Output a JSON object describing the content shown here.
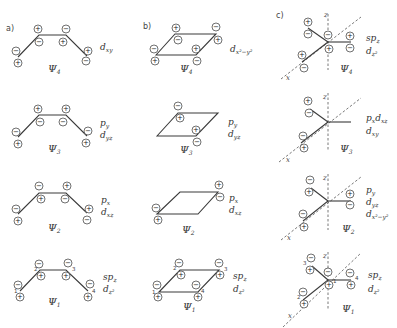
{
  "panels": [
    {
      "id": "a",
      "label": "a)",
      "type": "butadiene-chain"
    },
    {
      "id": "b",
      "label": "b)",
      "type": "cyclobutadiene-rhombus"
    },
    {
      "id": "c",
      "label": "c)",
      "type": "trimethylenemethane-star"
    }
  ],
  "orbitals": {
    "a": [
      {
        "name": "Ψ4",
        "psi": "Ψ",
        "sub": "4",
        "labels": [
          {
            "main": "d",
            "sub": "xy"
          }
        ],
        "atom_signs": [
          [
            "−",
            "+"
          ],
          [
            "+",
            "−"
          ],
          [
            "−",
            "+"
          ],
          [
            "+",
            "−"
          ]
        ]
      },
      {
        "name": "Ψ3",
        "psi": "Ψ",
        "sub": "3",
        "labels": [
          {
            "main": "p",
            "sub": "y"
          },
          {
            "main": "d",
            "sub": "yz"
          }
        ],
        "atom_signs": [
          [
            "−",
            "+"
          ],
          [
            "+",
            "−"
          ],
          [
            "+",
            "−"
          ],
          [
            "−",
            "+"
          ]
        ]
      },
      {
        "name": "Ψ2",
        "psi": "Ψ",
        "sub": "2",
        "labels": [
          {
            "main": "p",
            "sub": "x"
          },
          {
            "main": "d",
            "sub": "xz"
          }
        ],
        "atom_signs": [
          [
            "−",
            "+"
          ],
          [
            "−",
            "+"
          ],
          [
            "+",
            "−"
          ],
          [
            "+",
            "−"
          ]
        ]
      },
      {
        "name": "Ψ1",
        "psi": "Ψ",
        "sub": "1",
        "labels": [
          {
            "main": "sp",
            "sub": "z"
          },
          {
            "main": "d",
            "sub": "z²"
          }
        ],
        "atom_signs": [
          [
            "−",
            "+"
          ],
          [
            "−",
            "+"
          ],
          [
            "−",
            "+"
          ],
          [
            "−",
            "+"
          ]
        ],
        "atom_numbers": [
          "1",
          "2",
          "3",
          "4"
        ]
      }
    ],
    "b": [
      {
        "name": "Ψ4",
        "psi": "Ψ",
        "sub": "4",
        "labels": [
          {
            "main": "d",
            "sub": "x²−y²"
          }
        ]
      },
      {
        "name": "Ψ3",
        "psi": "Ψ",
        "sub": "3",
        "labels": [
          {
            "main": "p",
            "sub": "y"
          },
          {
            "main": "d",
            "sub": "yz"
          }
        ]
      },
      {
        "name": "Ψ2",
        "psi": "Ψ",
        "sub": "2",
        "labels": [
          {
            "main": "p",
            "sub": "x"
          },
          {
            "main": "d",
            "sub": "xz"
          }
        ]
      },
      {
        "name": "Ψ1",
        "psi": "Ψ",
        "sub": "1",
        "labels": [
          {
            "main": "sp",
            "sub": "z"
          },
          {
            "main": "d",
            "sub": "z²"
          }
        ],
        "atom_numbers": [
          "1",
          "2",
          "3",
          "4"
        ]
      }
    ],
    "c": [
      {
        "name": "Ψ4",
        "psi": "Ψ",
        "sub": "4",
        "labels": [
          {
            "main": "sp",
            "sub": "z"
          },
          {
            "main": "d",
            "sub": "z²"
          }
        ]
      },
      {
        "name": "Ψ3",
        "psi": "Ψ",
        "sub": "3",
        "labels": [
          {
            "main": "p",
            "sub": "x",
            "main2": "d",
            "sub2": "xz"
          },
          {
            "main": "d",
            "sub": "xy"
          }
        ]
      },
      {
        "name": "Ψ2",
        "psi": "Ψ",
        "sub": "2",
        "labels": [
          {
            "main": "p",
            "sub": "y"
          },
          {
            "main": "d",
            "sub": "yz"
          },
          {
            "main": "d",
            "sub": "x²−y²"
          }
        ]
      },
      {
        "name": "Ψ1",
        "psi": "Ψ",
        "sub": "1",
        "labels": [
          {
            "main": "sp",
            "sub": "z"
          },
          {
            "main": "d",
            "sub": "z²"
          }
        ],
        "atom_numbers": [
          "1",
          "2",
          "3",
          "4"
        ]
      }
    ]
  },
  "axes": {
    "x": "x",
    "z": "z"
  },
  "signs": {
    "plus": "+",
    "minus": "−"
  }
}
